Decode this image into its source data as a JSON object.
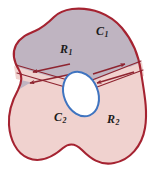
{
  "figure": {
    "background_color": "#ffffff",
    "labels": {
      "c1": {
        "base": "C",
        "sub": "1",
        "name": "outer-curve-label"
      },
      "r1": {
        "base": "R",
        "sub": "1",
        "name": "upper-region-label"
      },
      "c2": {
        "base": "C",
        "sub": "2",
        "name": "inner-curve-label"
      },
      "r2": {
        "base": "R",
        "sub": "2",
        "name": "lower-region-label"
      }
    },
    "colors": {
      "outer_boundary_stroke": "#a52331",
      "upper_region_fill": "#c3b8c4",
      "lower_region_fill": "#f0d2cf",
      "inner_curve_stroke": "#3f74c0",
      "inner_curve_fill": "#ffffff",
      "arrow_color": "#8e2430",
      "channel_fill": "#f0d2cf"
    },
    "arrows": [
      {
        "name": "channel-arrow-upper-left",
        "direction": "left",
        "note": "upper left channel wall arrow pointing away from inner curve"
      },
      {
        "name": "channel-arrow-lower-left",
        "direction": "left",
        "note": "lower left channel wall arrow pointing away from inner curve"
      },
      {
        "name": "channel-arrow-upper-right",
        "direction": "right",
        "note": "upper right channel wall arrow pointing away from inner curve"
      },
      {
        "name": "channel-arrow-lower-right",
        "direction": "left",
        "note": "lower right channel wall arrow pointing toward inner curve"
      }
    ]
  }
}
